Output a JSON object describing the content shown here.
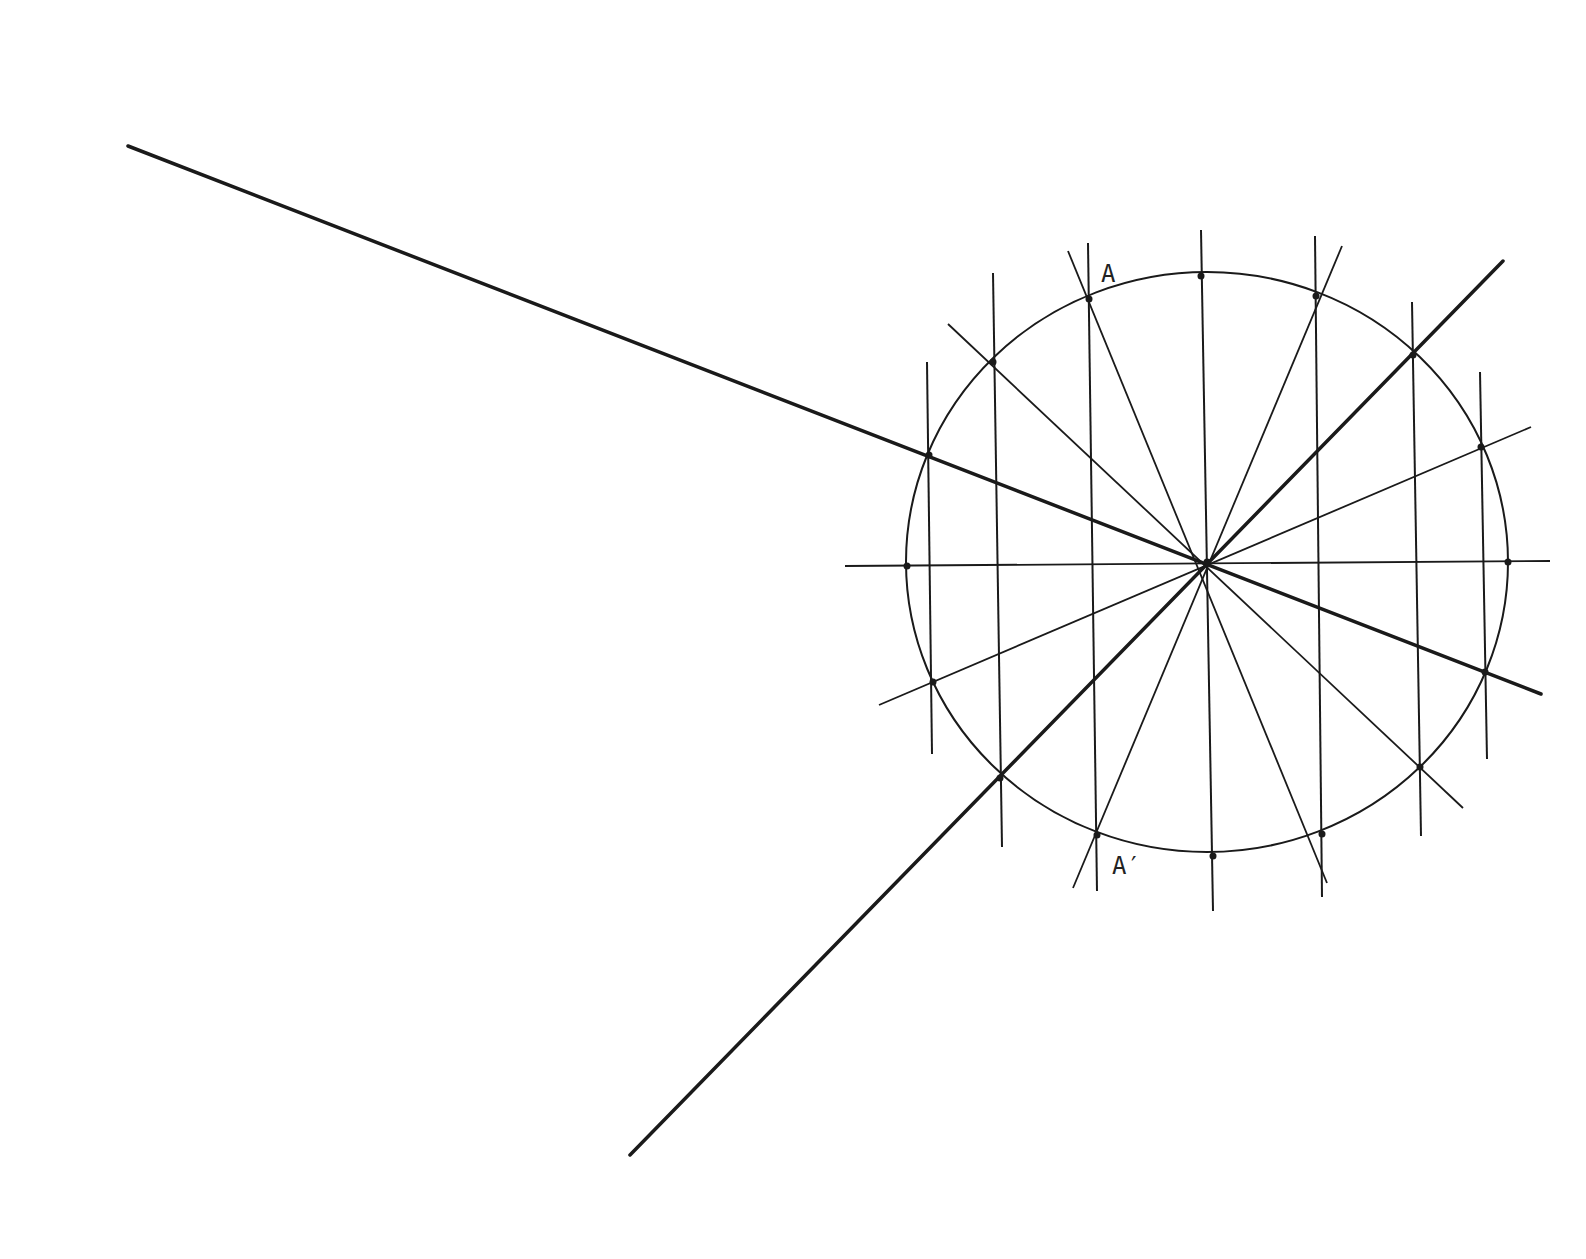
{
  "diagram": {
    "type": "geometric-construction",
    "colors": {
      "ink": "#1a1a1a",
      "background": "#ffffff"
    },
    "circle": {
      "cx": 1207,
      "cy": 562,
      "rx": 301,
      "ry": 290
    },
    "center": {
      "x": 1207,
      "y": 562
    },
    "labels": [
      {
        "id": "A",
        "text": "A",
        "x": 1101,
        "y": 282
      },
      {
        "id": "A_prime",
        "text": "A′",
        "x": 1112,
        "y": 874
      }
    ],
    "thick_lines": [
      {
        "name": "long-line-upper-left",
        "x1": 128,
        "y1": 146,
        "x2": 1541,
        "y2": 694
      },
      {
        "name": "long-line-lower-left",
        "x1": 630,
        "y1": 1155,
        "x2": 1503,
        "y2": 261
      }
    ],
    "radial_lines": [
      {
        "name": "horizontal-diameter",
        "x1": 845,
        "y1": 566,
        "x2": 1550,
        "y2": 561
      },
      {
        "name": "radial-shallow",
        "x1": 879,
        "y1": 705,
        "x2": 1531,
        "y2": 427
      },
      {
        "name": "radial-135",
        "x1": 948,
        "y1": 324,
        "x2": 1463,
        "y2": 808
      },
      {
        "name": "radial-112",
        "x1": 1068,
        "y1": 251,
        "x2": 1327,
        "y2": 883
      },
      {
        "name": "radial-68",
        "x1": 1073,
        "y1": 888,
        "x2": 1342,
        "y2": 246
      }
    ],
    "vertical_lines": [
      {
        "name": "vertical-1",
        "x1": 927,
        "y1": 362,
        "x2": 932,
        "y2": 754
      },
      {
        "name": "vertical-2",
        "x1": 993,
        "y1": 273,
        "x2": 1002,
        "y2": 847
      },
      {
        "name": "vertical-3",
        "x1": 1088,
        "y1": 243,
        "x2": 1097,
        "y2": 891
      },
      {
        "name": "vertical-center",
        "x1": 1201,
        "y1": 230,
        "x2": 1213,
        "y2": 911
      },
      {
        "name": "vertical-4",
        "x1": 1315,
        "y1": 236,
        "x2": 1322,
        "y2": 897
      },
      {
        "name": "vertical-5",
        "x1": 1412,
        "y1": 302,
        "x2": 1421,
        "y2": 836
      },
      {
        "name": "vertical-6",
        "x1": 1480,
        "y1": 372,
        "x2": 1487,
        "y2": 759
      }
    ],
    "points": [
      {
        "x": 1201,
        "y": 276
      },
      {
        "x": 1316,
        "y": 296
      },
      {
        "x": 1413,
        "y": 355
      },
      {
        "x": 1481,
        "y": 447
      },
      {
        "x": 1508,
        "y": 562
      },
      {
        "x": 1485,
        "y": 672
      },
      {
        "x": 1420,
        "y": 767
      },
      {
        "x": 1322,
        "y": 834
      },
      {
        "x": 1213,
        "y": 856
      },
      {
        "x": 1097,
        "y": 835
      },
      {
        "x": 1000,
        "y": 778
      },
      {
        "x": 933,
        "y": 682
      },
      {
        "x": 907,
        "y": 566
      },
      {
        "x": 929,
        "y": 455
      },
      {
        "x": 993,
        "y": 362
      },
      {
        "x": 1089,
        "y": 299
      },
      {
        "x": 1207,
        "y": 562
      }
    ]
  }
}
